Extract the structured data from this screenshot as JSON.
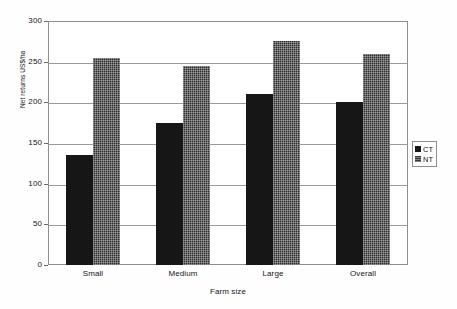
{
  "chart_data": {
    "type": "bar",
    "title": "",
    "subtitle": "",
    "xlabel": "Farm size",
    "ylabel": "Net returns US$/ha",
    "categories": [
      "Small",
      "Medium",
      "Large",
      "Overall"
    ],
    "series": [
      {
        "name": "CT",
        "values": [
          135,
          175,
          210,
          200
        ],
        "color": "#161616"
      },
      {
        "name": "NT",
        "values": [
          255,
          245,
          275,
          260
        ],
        "color": "#2e2e2e"
      }
    ],
    "ylim": [
      0,
      300
    ],
    "ytick_labels": [
      "0",
      "50",
      "100",
      "150",
      "200",
      "250",
      "300"
    ],
    "ytick_values": [
      0,
      50,
      100,
      150,
      200,
      250,
      300
    ],
    "grid": "horizontal",
    "legend_position": "right",
    "legend_entries": [
      "CT",
      "NT"
    ],
    "annotations": []
  },
  "axes": {
    "y_title": "Net returns US$/ha",
    "x_title": "Farm size"
  },
  "legend": {
    "items": [
      {
        "label": "CT"
      },
      {
        "label": "NT"
      }
    ]
  },
  "icons": {
    "legend_swatch_ct": "square-solid-icon",
    "legend_swatch_nt": "square-hatched-icon"
  }
}
